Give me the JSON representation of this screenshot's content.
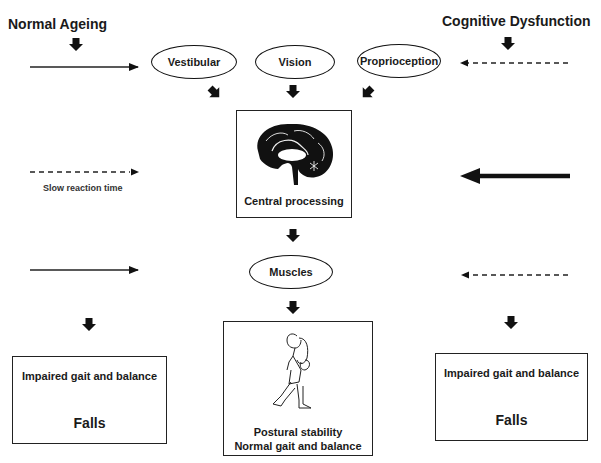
{
  "diagram": {
    "left_header": "Normal Ageing",
    "right_header": "Cognitive Dysfunction",
    "inputs": [
      {
        "label": "Vestibular"
      },
      {
        "label": "Vision"
      },
      {
        "label": "Proprioception"
      }
    ],
    "central": {
      "label": "Central processing",
      "icon": "brain-icon"
    },
    "left_side_note": "Slow reaction time",
    "muscles": {
      "label": "Muscles"
    },
    "outcome_center": {
      "line1": "Postural stability",
      "line2": "Normal gait and balance",
      "icon": "walking-woman-icon"
    },
    "outcome_left": {
      "line1": "Impaired gait and balance",
      "line2": "Falls"
    },
    "outcome_right": {
      "line1": "Impaired gait and balance",
      "line2": "Falls"
    },
    "arrow_styles": {
      "left_top": "solid-thin",
      "left_middle": "dashed",
      "left_bottom": "solid-thin",
      "right_top": "dashed",
      "right_middle": "solid-thick",
      "right_bottom": "dashed"
    }
  }
}
